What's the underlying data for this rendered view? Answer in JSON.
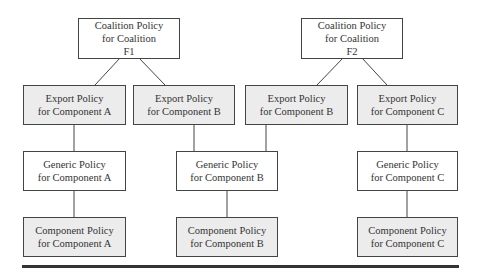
{
  "diagram": {
    "coalitions": [
      {
        "id": "F1",
        "lines": [
          "Coalition Policy",
          "for Coalition",
          "F1"
        ]
      },
      {
        "id": "F2",
        "lines": [
          "Coalition Policy",
          "for Coalition",
          "F2"
        ]
      }
    ],
    "export_policies": [
      {
        "coalition": "F1",
        "lines": [
          "Export Policy",
          "for Component A"
        ]
      },
      {
        "coalition": "F1",
        "lines": [
          "Export Policy",
          "for Component B"
        ]
      },
      {
        "coalition": "F2",
        "lines": [
          "Export Policy",
          "for Component B"
        ]
      },
      {
        "coalition": "F2",
        "lines": [
          "Export Policy",
          "for Component C"
        ]
      }
    ],
    "generic_policies": [
      {
        "component": "A",
        "lines": [
          "Generic Policy",
          "for Component A"
        ]
      },
      {
        "component": "B",
        "lines": [
          "Generic Policy",
          "for Component B"
        ]
      },
      {
        "component": "C",
        "lines": [
          "Generic Policy",
          "for Component C"
        ]
      }
    ],
    "component_policies": [
      {
        "component": "A",
        "lines": [
          "Component Policy",
          "for Component A"
        ]
      },
      {
        "component": "B",
        "lines": [
          "Component Policy",
          "for Component B"
        ]
      },
      {
        "component": "C",
        "lines": [
          "Component Policy",
          "for Component C"
        ]
      }
    ],
    "colors": {
      "border": "#444444",
      "shaded_fill": "#ececec",
      "plain_fill": "#ffffff",
      "rule": "#333333"
    }
  }
}
